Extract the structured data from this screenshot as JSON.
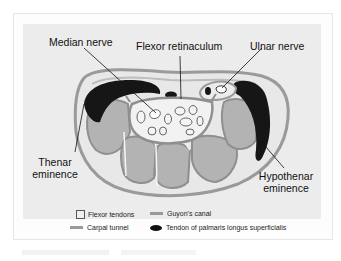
{
  "figure": {
    "labels": {
      "median_nerve": "Median nerve",
      "flexor_retinaculum": "Flexor retinaculum",
      "ulnar_nerve": "Ulnar nerve",
      "thenar_line1": "Thenar",
      "thenar_line2": "eminence",
      "hypothenar_line1": "Hypothenar",
      "hypothenar_line2": "eminence"
    },
    "legend": [
      {
        "icon": "square-outline",
        "label": "Flexor tendons"
      },
      {
        "icon": "gray-bar",
        "label": "Guyon's canal"
      },
      {
        "icon": "gray-bar",
        "label": "Carpal tunnel"
      },
      {
        "icon": "black-oval",
        "label": "Tendon of palmaris longus superficialis"
      }
    ],
    "colors": {
      "panel_bg": "#ececec",
      "outline": "#9a9a9a",
      "bone": "#b3b3b3",
      "muscle": "#161616",
      "tunnel_fill": "#f2f2f2"
    }
  }
}
